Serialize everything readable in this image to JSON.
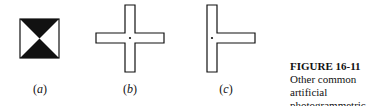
{
  "figure": {
    "number": "FIGURE 16-11",
    "caption_line1": "Other common artificial",
    "caption_line2": "photogrammetric targets."
  },
  "panels": [
    {
      "id": "a",
      "label": "(a)",
      "description": "square target with black hourglass triangles"
    },
    {
      "id": "b",
      "label": "(b)",
      "description": "cross-shaped target with center dot"
    },
    {
      "id": "c",
      "label": "(c)",
      "description": "T-shaped target with dot at junction"
    }
  ],
  "colors": {
    "ink": "#111111",
    "background": "#ffffff"
  }
}
